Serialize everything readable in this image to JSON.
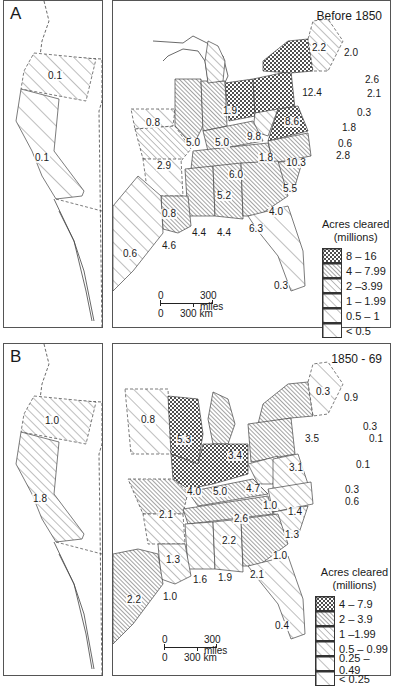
{
  "panels": [
    {
      "letter": "A",
      "period": "Before 1850",
      "west_labels": [
        {
          "value": "0.1",
          "region": "oregon-territory"
        },
        {
          "value": "0.1",
          "region": "california"
        }
      ],
      "east_labels": [
        {
          "value": "2.2",
          "region": "vermont"
        },
        {
          "value": "2.0",
          "region": "maine"
        },
        {
          "value": "2.6",
          "region": "new-hampshire"
        },
        {
          "value": "2.1",
          "region": "massachusetts"
        },
        {
          "value": "0.3",
          "region": "rhode-island"
        },
        {
          "value": "1.8",
          "region": "connecticut"
        },
        {
          "value": "0.6",
          "region": "delaware"
        },
        {
          "value": "2.8",
          "region": "maryland-nj"
        },
        {
          "value": "12.4",
          "region": "new-york"
        },
        {
          "value": "8.6",
          "region": "pennsylvania"
        },
        {
          "value": "9.8",
          "region": "ohio"
        },
        {
          "value": "1.9",
          "region": "michigan"
        },
        {
          "value": "5.0",
          "region": "illinois"
        },
        {
          "value": "5.0",
          "region": "indiana"
        },
        {
          "value": "0.8",
          "region": "iowa"
        },
        {
          "value": "2.9",
          "region": "missouri"
        },
        {
          "value": "1.8",
          "region": "west-virginia"
        },
        {
          "value": "10.3",
          "region": "virginia"
        },
        {
          "value": "6.0",
          "region": "kentucky"
        },
        {
          "value": "5.5",
          "region": "north-carolina"
        },
        {
          "value": "5.2",
          "region": "tennessee"
        },
        {
          "value": "4.0",
          "region": "south-carolina"
        },
        {
          "value": "0.8",
          "region": "arkansas"
        },
        {
          "value": "4.4",
          "region": "mississippi"
        },
        {
          "value": "4.4",
          "region": "alabama"
        },
        {
          "value": "6.3",
          "region": "georgia"
        },
        {
          "value": "4.6",
          "region": "louisiana"
        },
        {
          "value": "0.6",
          "region": "texas"
        },
        {
          "value": "0.3",
          "region": "florida"
        }
      ],
      "legend": {
        "title_line1": "Acres cleared",
        "title_line2": "(millions)",
        "items": [
          {
            "label": "8 – 16",
            "pattern": "crosshatch"
          },
          {
            "label": "4 – 7.99",
            "pattern": "dense-hatch"
          },
          {
            "label": "2 –3.99",
            "pattern": "medium-hatch"
          },
          {
            "label": "1 – 1.99",
            "pattern": "light-hatch"
          },
          {
            "label": "0.5 – 1",
            "pattern": "sparse-hatch"
          },
          {
            "label": "< 0.5",
            "pattern": "very-sparse-hatch"
          }
        ]
      },
      "scale": {
        "miles_zero": "0",
        "miles_label": "300 miles",
        "km_zero": "0",
        "km_label": "300 km"
      }
    },
    {
      "letter": "B",
      "period": "1850 - 69",
      "west_labels": [
        {
          "value": "1.0",
          "region": "oregon-territory"
        },
        {
          "value": "1.8",
          "region": "california"
        }
      ],
      "east_labels": [
        {
          "value": "0.3",
          "region": "vermont"
        },
        {
          "value": "0.9",
          "region": "maine"
        },
        {
          "value": "0.3",
          "region": "new-hampshire"
        },
        {
          "value": "0.1",
          "region": "massachusetts"
        },
        {
          "value": "0.1",
          "region": "rhode-island-ct"
        },
        {
          "value": "0.3",
          "region": "delaware"
        },
        {
          "value": "0.6",
          "region": "maryland-nj"
        },
        {
          "value": "3.5",
          "region": "new-york"
        },
        {
          "value": "3.1",
          "region": "pennsylvania"
        },
        {
          "value": "3.4",
          "region": "michigan"
        },
        {
          "value": "5.3",
          "region": "wisconsin"
        },
        {
          "value": "0.8",
          "region": "minnesota"
        },
        {
          "value": "4.0",
          "region": "iowa-illinois"
        },
        {
          "value": "5.0",
          "region": "indiana"
        },
        {
          "value": "4.7",
          "region": "ohio"
        },
        {
          "value": "1.0",
          "region": "west-virginia"
        },
        {
          "value": "1.4",
          "region": "virginia"
        },
        {
          "value": "2.1",
          "region": "missouri"
        },
        {
          "value": "2.6",
          "region": "kentucky"
        },
        {
          "value": "1.3",
          "region": "north-carolina"
        },
        {
          "value": "2.2",
          "region": "tennessee"
        },
        {
          "value": "1.0",
          "region": "south-carolina"
        },
        {
          "value": "1.3",
          "region": "arkansas"
        },
        {
          "value": "1.6",
          "region": "mississippi"
        },
        {
          "value": "1.9",
          "region": "alabama"
        },
        {
          "value": "2.1",
          "region": "georgia"
        },
        {
          "value": "1.0",
          "region": "louisiana"
        },
        {
          "value": "2.2",
          "region": "texas"
        },
        {
          "value": "0.4",
          "region": "florida"
        }
      ],
      "legend": {
        "title_line1": "Acres cleared",
        "title_line2": "(millions)",
        "items": [
          {
            "label": "4 – 7.9",
            "pattern": "crosshatch"
          },
          {
            "label": "2 – 3.9",
            "pattern": "dense-hatch"
          },
          {
            "label": "1 –1.99",
            "pattern": "medium-hatch"
          },
          {
            "label": "0.5 – 0.99",
            "pattern": "light-hatch"
          },
          {
            "label": "0.25 – 0.49",
            "pattern": "sparse-hatch"
          },
          {
            "label": "< 0.25",
            "pattern": "very-sparse-hatch"
          }
        ]
      },
      "scale": {
        "miles_zero": "0",
        "miles_label": "300 miles",
        "km_zero": "0",
        "km_label": "300 km"
      }
    }
  ]
}
